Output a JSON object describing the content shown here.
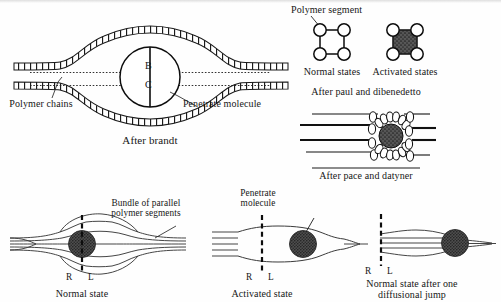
{
  "figure": {
    "title_semantic": "schematic-models-of-penetrant-diffusion-in-polymers",
    "background_color": "#fefefe",
    "ink_color": "#161616",
    "fill_color": "#4a4a4a"
  },
  "panel_brandt": {
    "name": "After brandt",
    "caption": "After brandt",
    "label_polymer_chains": "Polymer chains",
    "label_penetrate_molecule": "Penetrate molecule",
    "marker_top": "B",
    "marker_bottom": "C"
  },
  "panel_paul": {
    "heading": "Polymer segment",
    "label_normal": "Normal states",
    "label_activated": "Activated states",
    "caption": "After paul and dibenedetto",
    "segment_nodes": 4
  },
  "panel_pace": {
    "caption": "After pace and datyner",
    "chain_lines": 4
  },
  "panel_normal_state": {
    "caption": "Normal state",
    "label_bundle": "Bundle of parallel polymer segments",
    "label_bundle_line1": "Bundle of parallel",
    "label_bundle_line2": "polymer segments",
    "marker_left": "R",
    "marker_right": "L"
  },
  "panel_activated_state": {
    "caption": "Activated state",
    "label_penetrate_line1": "Penetrate",
    "label_penetrate_line2": "molecule",
    "marker_left": "R",
    "marker_right": "L"
  },
  "panel_after_jump": {
    "caption_line1": "Normal state after one",
    "caption_line2": "diffusional jump",
    "marker_left": "R",
    "marker_right": "L"
  }
}
